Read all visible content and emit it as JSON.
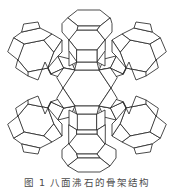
{
  "figure": {
    "background_color": "#ffffff",
    "line_color": "#2a2a2a",
    "back_line_color": "#6a6a6a",
    "fill_color": "#ffffff",
    "alt": "faujasite-zeolite-framework-wireframe",
    "caption": "图 1 八面沸石的骨架结构",
    "caption_visible_note": "caption is cropped to the top sliver of the glyphs"
  },
  "structure": {
    "type": "zeolite-framework-polyhedra",
    "cage_count": 9,
    "cages": [
      {
        "id": "cage-top-center",
        "label": "sodalite-cage-top-center",
        "cx": 89,
        "cy": 34,
        "r": 26,
        "depth": "front"
      },
      {
        "id": "cage-upper-left",
        "label": "sodalite-cage-upper-left",
        "cx": 33,
        "cy": 56,
        "r": 25,
        "depth": "front"
      },
      {
        "id": "cage-upper-right",
        "label": "sodalite-cage-upper-right",
        "cx": 141,
        "cy": 56,
        "r": 25,
        "depth": "front"
      },
      {
        "id": "cage-center",
        "label": "supercage-center",
        "cx": 87,
        "cy": 88,
        "r": 27,
        "depth": "core"
      },
      {
        "id": "cage-lower-left",
        "label": "sodalite-cage-lower-left",
        "cx": 33,
        "cy": 120,
        "r": 25,
        "depth": "front"
      },
      {
        "id": "cage-lower-right",
        "label": "sodalite-cage-lower-right",
        "cx": 141,
        "cy": 120,
        "r": 25,
        "depth": "front"
      },
      {
        "id": "cage-bottom-center",
        "label": "sodalite-cage-bottom-center",
        "cx": 87,
        "cy": 142,
        "r": 26,
        "depth": "front"
      }
    ],
    "linkers": [
      {
        "id": "linker-top-left",
        "label": "double-ring-prism-top-left"
      },
      {
        "id": "linker-top-right",
        "label": "double-ring-prism-top-right"
      },
      {
        "id": "linker-bottom-left",
        "label": "double-ring-prism-bottom-left"
      },
      {
        "id": "linker-bottom-right",
        "label": "double-ring-prism-bottom-right"
      },
      {
        "id": "linker-top",
        "label": "double-ring-prism-top"
      },
      {
        "id": "linker-bottom",
        "label": "double-ring-prism-bottom"
      },
      {
        "id": "linker-left",
        "label": "double-ring-prism-left"
      },
      {
        "id": "linker-right",
        "label": "double-ring-prism-right"
      }
    ]
  }
}
